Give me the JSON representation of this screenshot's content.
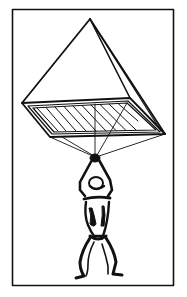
{
  "illustration": {
    "subject": "Pyramid parachute sketch with hanging figure",
    "colors": {
      "ink": "#111111",
      "paper": "#ffffff"
    },
    "frame": {
      "x": 12,
      "y": 9,
      "width": 161,
      "height": 276,
      "stroke": 1.6
    },
    "canopy": {
      "apex": [
        90,
        19
      ],
      "base": {
        "left": [
          22,
          103
        ],
        "back_right": [
          130,
          98
        ],
        "front_right": [
          165,
          134
        ],
        "front_left": [
          50,
          137
        ]
      },
      "inner_panel": {
        "left": [
          33,
          108
        ],
        "back_right": [
          127,
          103
        ],
        "front_right": [
          156,
          130
        ],
        "front_left": [
          54,
          132
        ]
      },
      "hatch_lines": 10
    },
    "suspension": {
      "hands_point": [
        95,
        157
      ],
      "lines_from": [
        "front_left",
        "inner_back_mid",
        "front_right",
        "back_right",
        "center"
      ]
    },
    "figure": {
      "pose": "arms raised gripping lines, knees bent"
    }
  }
}
